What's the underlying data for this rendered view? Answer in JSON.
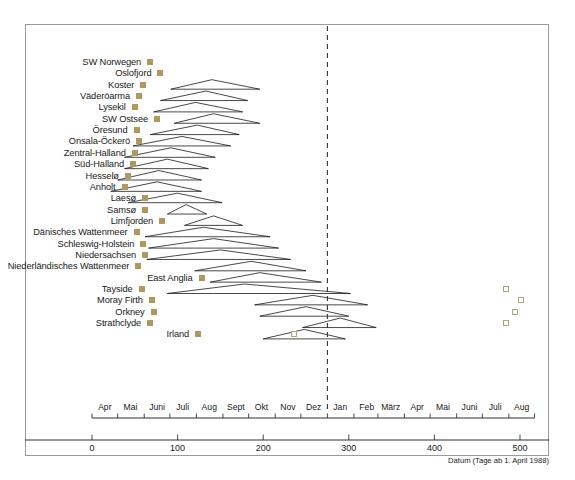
{
  "chart_data": {
    "type": "scatter",
    "title": "",
    "xlabel": "Datum (Tage ab 1. April 1988)",
    "ylabel": "",
    "xlim": [
      -105,
      545
    ],
    "ylim": [
      0,
      24
    ],
    "grid": false,
    "legend_position": "none",
    "annotations": {
      "reference_line_label": "Jan",
      "reference_line_value": 275
    },
    "x_axis": {
      "numeric_ticks": [
        0,
        100,
        200,
        300,
        400,
        500
      ],
      "numeric_tick_labels": [
        "0",
        "100",
        "200",
        "300",
        "400",
        "500"
      ],
      "month_ticks": [
        {
          "label": "Apr",
          "value": 15
        },
        {
          "label": "Mai",
          "value": 45
        },
        {
          "label": "Juni",
          "value": 76
        },
        {
          "label": "Juli",
          "value": 106
        },
        {
          "label": "Aug",
          "value": 137
        },
        {
          "label": "Sept",
          "value": 168
        },
        {
          "label": "Okt",
          "value": 198
        },
        {
          "label": "Nov",
          "value": 229
        },
        {
          "label": "Dez",
          "value": 259
        },
        {
          "label": "Jan",
          "value": 290
        },
        {
          "label": "Feb",
          "value": 321
        },
        {
          "label": "März",
          "value": 349
        },
        {
          "label": "Apr",
          "value": 380
        },
        {
          "label": "Mai",
          "value": 410
        },
        {
          "label": "Juni",
          "value": 441
        },
        {
          "label": "Juli",
          "value": 471
        },
        {
          "label": "Aug",
          "value": 502
        }
      ],
      "month_boundaries": [
        0,
        30,
        61,
        91,
        122,
        153,
        183,
        214,
        244,
        275,
        306,
        334,
        365,
        395,
        426,
        456,
        487,
        517
      ]
    },
    "series": [
      {
        "name": "Ausbruchsbeginn (gefülltes Quadrat)",
        "marker": "filled-square",
        "color": "#ae9a5f"
      },
      {
        "name": "Zusatzbeobachtung (offenes Quadrat)",
        "marker": "open-square",
        "color": "#b3a475"
      },
      {
        "name": "Epidemieverlauf (Dreieck)",
        "marker": "triangle-outline",
        "color": "#1a1a1a"
      }
    ],
    "rows": [
      {
        "label": "SW Norwegen",
        "onset": 68,
        "tri_start": null,
        "tri_peak": null,
        "tri_end": null,
        "open_squares": []
      },
      {
        "label": "Oslofjord",
        "onset": 80,
        "tri_start": null,
        "tri_peak": null,
        "tri_end": null,
        "open_squares": []
      },
      {
        "label": "Koster",
        "onset": 60,
        "tri_start": 92,
        "tri_peak": 140,
        "tri_end": 196,
        "open_squares": []
      },
      {
        "label": "Väderöarma",
        "onset": 55,
        "tri_start": 80,
        "tri_peak": 133,
        "tri_end": 182,
        "open_squares": []
      },
      {
        "label": "Lysekil",
        "onset": 50,
        "tri_start": 72,
        "tri_peak": 121,
        "tri_end": 176,
        "open_squares": []
      },
      {
        "label": "SW Ostsee",
        "onset": 76,
        "tri_start": 96,
        "tri_peak": 142,
        "tri_end": 196,
        "open_squares": []
      },
      {
        "label": "Öresund",
        "onset": 52,
        "tri_start": 68,
        "tri_peak": 123,
        "tri_end": 172,
        "open_squares": []
      },
      {
        "label": "Onsala-Öckerö",
        "onset": 55,
        "tri_start": 48,
        "tri_peak": 105,
        "tri_end": 162,
        "open_squares": []
      },
      {
        "label": "Zentral-Halland",
        "onset": 50,
        "tri_start": 38,
        "tri_peak": 92,
        "tri_end": 144,
        "open_squares": []
      },
      {
        "label": "Süd-Halland",
        "onset": 48,
        "tri_start": 38,
        "tri_peak": 88,
        "tri_end": 136,
        "open_squares": []
      },
      {
        "label": "Hesselø",
        "onset": 42,
        "tri_start": 30,
        "tri_peak": 78,
        "tri_end": 128,
        "open_squares": []
      },
      {
        "label": "Anholt",
        "onset": 38,
        "tri_start": 22,
        "tri_peak": 76,
        "tri_end": 128,
        "open_squares": []
      },
      {
        "label": "Laesø",
        "onset": 62,
        "tri_start": 42,
        "tri_peak": 100,
        "tri_end": 152,
        "open_squares": []
      },
      {
        "label": "Samsø",
        "onset": 62,
        "tri_start": 88,
        "tri_peak": 110,
        "tri_end": 134,
        "open_squares": []
      },
      {
        "label": "Limfjorden",
        "onset": 82,
        "tri_start": 108,
        "tri_peak": 142,
        "tri_end": 176,
        "open_squares": []
      },
      {
        "label": "Dänisches Wattenmeer",
        "onset": 52,
        "tri_start": 62,
        "tri_peak": 130,
        "tri_end": 208,
        "open_squares": []
      },
      {
        "label": "Schleswig-Holstein",
        "onset": 60,
        "tri_start": 66,
        "tri_peak": 142,
        "tri_end": 218,
        "open_squares": []
      },
      {
        "label": "Niedersachsen",
        "onset": 62,
        "tri_start": 64,
        "tri_peak": 150,
        "tri_end": 232,
        "open_squares": []
      },
      {
        "label": "Niederländisches Wattenmeer",
        "onset": 54,
        "tri_start": 120,
        "tri_peak": 186,
        "tri_end": 250,
        "open_squares": []
      },
      {
        "label": "East Anglia",
        "onset": 128,
        "tri_start": 138,
        "tri_peak": 196,
        "tri_end": 268,
        "open_squares": []
      },
      {
        "label": "Tayside",
        "onset": 58,
        "tri_start": 88,
        "tri_peak": 178,
        "tri_end": 302,
        "open_squares": [
          484
        ]
      },
      {
        "label": "Moray Firth",
        "onset": 70,
        "tri_start": 190,
        "tri_peak": 258,
        "tri_end": 322,
        "open_squares": [
          501
        ]
      },
      {
        "label": "Orkney",
        "onset": 72,
        "tri_start": 196,
        "tri_peak": 250,
        "tri_end": 300,
        "open_squares": [
          494
        ]
      },
      {
        "label": "Strathclyde",
        "onset": 68,
        "tri_start": 246,
        "tri_peak": 290,
        "tri_end": 332,
        "open_squares": [
          484
        ]
      },
      {
        "label": "Irland",
        "onset": 124,
        "tri_start": 200,
        "tri_peak": 248,
        "tri_end": 296,
        "open_squares": [
          236
        ]
      }
    ]
  }
}
